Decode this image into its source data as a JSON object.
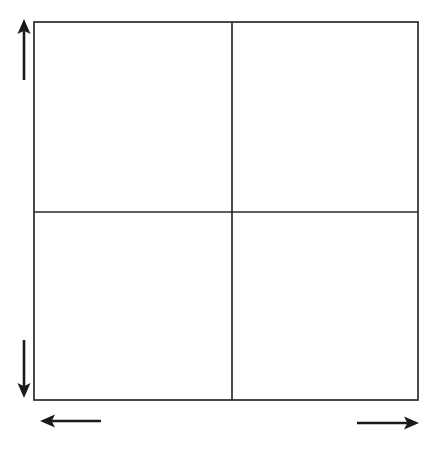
{
  "figure": {
    "type": "diagram",
    "subtype": "four-quadrant-grid",
    "background_color": "#ffffff",
    "stroke_color": "#2b2b2b",
    "arrow_color": "#1a1a1a",
    "canvas": {
      "width": 423,
      "height": 455
    },
    "title": "",
    "caption": "",
    "labels": []
  },
  "grid": {
    "name": "quadrant-grid",
    "x": 34,
    "y": 22,
    "width": 384,
    "height": 378,
    "border_width": 1.7,
    "border_color": "#2b2b2b",
    "fill": "#ffffff",
    "divider_x": 232,
    "divider_y": 212,
    "divider_width": 1.7,
    "rows": 2,
    "columns": 2,
    "quadrants": [
      {
        "name": "quadrant-top-left",
        "label": "",
        "x": 34,
        "y": 22,
        "width": 198,
        "height": 190
      },
      {
        "name": "quadrant-top-right",
        "label": "",
        "x": 232,
        "y": 22,
        "width": 186,
        "height": 190
      },
      {
        "name": "quadrant-bottom-left",
        "label": "",
        "x": 34,
        "y": 212,
        "width": 198,
        "height": 188
      },
      {
        "name": "quadrant-bottom-right",
        "label": "",
        "x": 232,
        "y": 212,
        "width": 186,
        "height": 188
      }
    ]
  },
  "arrows": [
    {
      "name": "arrow-up",
      "direction": "up",
      "label": "",
      "tail": {
        "x": 24,
        "y": 80
      },
      "tip": {
        "x": 24,
        "y": 19
      },
      "shaft_width": 2.6,
      "head_length": 15,
      "head_width": 13,
      "color": "#1a1a1a"
    },
    {
      "name": "arrow-down",
      "direction": "down",
      "label": "",
      "tail": {
        "x": 24,
        "y": 340
      },
      "tip": {
        "x": 24,
        "y": 398
      },
      "shaft_width": 2.6,
      "head_length": 15,
      "head_width": 13,
      "color": "#1a1a1a"
    },
    {
      "name": "arrow-left",
      "direction": "left",
      "label": "",
      "tail": {
        "x": 101,
        "y": 421
      },
      "tip": {
        "x": 40,
        "y": 421
      },
      "shaft_width": 2.6,
      "head_length": 15,
      "head_width": 13,
      "color": "#1a1a1a"
    },
    {
      "name": "arrow-right",
      "direction": "right",
      "label": "",
      "tail": {
        "x": 357,
        "y": 423
      },
      "tip": {
        "x": 419,
        "y": 423
      },
      "shaft_width": 2.6,
      "head_length": 15,
      "head_width": 13,
      "color": "#1a1a1a"
    }
  ],
  "accessibility": {
    "figure_description": "An empty two-by-two grid of four square cells with a vertical arrow pointing up at the upper left, a vertical arrow pointing down at the lower left, a horizontal arrow pointing left below the lower left corner, and a horizontal arrow pointing right below the lower right corner."
  }
}
